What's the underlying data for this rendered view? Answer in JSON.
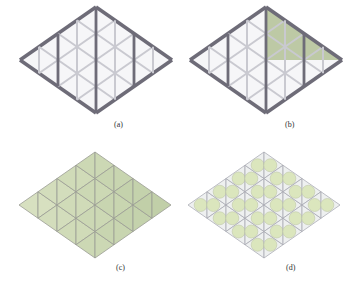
{
  "figure": {
    "panels": [
      {
        "id": "a",
        "label": "(a)",
        "description": "Bare triangular lattice frame (rhombus), grey struts"
      },
      {
        "id": "b",
        "label": "(b)",
        "description": "Lattice frame with upper-right triangular region covered by green panels"
      },
      {
        "id": "c",
        "label": "(c)",
        "description": "Rhombus fully covered by pale green triangular panels"
      },
      {
        "id": "d",
        "label": "(d)",
        "description": "Translucent triangular panels each containing a circular green disk"
      }
    ]
  },
  "colors": {
    "strut_dark": "#6e6c78",
    "strut_light": "#c9c9d0",
    "panel_green": "#a9b98a",
    "panel_green_light": "#dfe6c9",
    "disk_green": "#dbe6bd",
    "frame_bg": "#eef0f0"
  }
}
